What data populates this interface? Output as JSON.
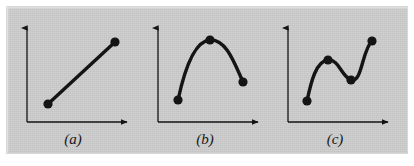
{
  "figure": {
    "background_color": "#c9c9c9",
    "page_color": "#ffffff",
    "ink_color": "#141414",
    "panels": [
      {
        "id": "a",
        "label": "(a)",
        "caption_text": "(a)",
        "curve_type": "straight-line-segment",
        "axis": {
          "origin_x": 27,
          "origin_y": 122,
          "y_top": 24,
          "x_right": 131,
          "arrowheads": [
            "up",
            "right"
          ]
        },
        "points": [
          {
            "x": 48,
            "y": 104
          },
          {
            "x": 115,
            "y": 42
          }
        ],
        "path": "M 48 104 L 115 42"
      },
      {
        "id": "b",
        "label": "(b)",
        "caption_text": "(b)",
        "curve_type": "single-arch-curve",
        "axis": {
          "origin_x": 158,
          "origin_y": 122,
          "y_top": 24,
          "x_right": 262,
          "arrowheads": [
            "up",
            "right"
          ]
        },
        "points": [
          {
            "x": 178,
            "y": 100
          },
          {
            "x": 210,
            "y": 40
          },
          {
            "x": 243,
            "y": 82
          }
        ],
        "path": "M 178 100 C 184 72 194 41 210 40 C 226 39 234 62 243 82"
      },
      {
        "id": "c",
        "label": "(c)",
        "caption_text": "(c)",
        "curve_type": "wavy-curve",
        "axis": {
          "origin_x": 288,
          "origin_y": 122,
          "y_top": 24,
          "x_right": 392,
          "arrowheads": [
            "up",
            "right"
          ]
        },
        "points": [
          {
            "x": 307,
            "y": 101
          },
          {
            "x": 328,
            "y": 60
          },
          {
            "x": 351,
            "y": 80
          },
          {
            "x": 372,
            "y": 41
          }
        ],
        "path": "M 307 101 C 311 82 316 61 328 60 C 339 59 341 76 351 80 C 362 84 362 50 372 41"
      }
    ],
    "stroke_width": 3.4,
    "axis_stroke_width": 1.3,
    "dot_radius": 4.6
  }
}
